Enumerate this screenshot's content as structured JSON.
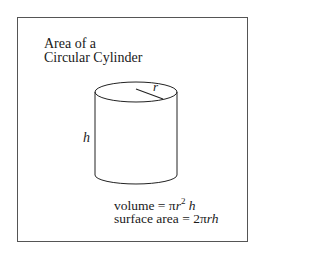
{
  "title": {
    "line1": "Area of a",
    "line2": "Circular Cylinder"
  },
  "labels": {
    "radius": "r",
    "height": "h"
  },
  "formulas": {
    "volume_label": "volume = ",
    "volume_expr_pi": "π",
    "volume_expr_r": "r",
    "volume_expr_exp": "2",
    "volume_expr_h": "h",
    "surface_label": "surface area = 2",
    "surface_expr_pi": "π",
    "surface_expr_rh": "rh"
  },
  "colors": {
    "stroke": "#222222",
    "frame": "#555555",
    "background": "#ffffff"
  }
}
